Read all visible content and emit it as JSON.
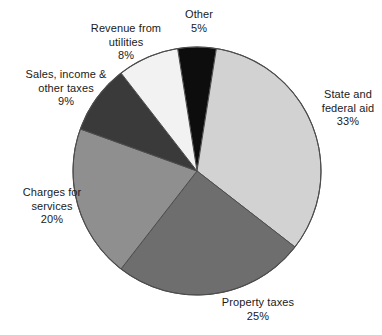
{
  "chart_data": {
    "type": "pie",
    "title": "",
    "subtitle": "",
    "xlabel": "",
    "ylabel": "",
    "legend_position": "none",
    "grid": false,
    "value_unit": "%",
    "start_angle_deg": -9,
    "direction": "clockwise",
    "categories": [
      "Other",
      "State and federal aid",
      "Property taxes",
      "Charges for services",
      "Sales, income & other taxes",
      "Revenue from utilities"
    ],
    "values": [
      5,
      33,
      25,
      20,
      9,
      8
    ],
    "slices": [
      {
        "id": "other",
        "label_line1": "Other",
        "label_line2": "",
        "value": 5,
        "value_text": "5%",
        "color": "#0d0d0d"
      },
      {
        "id": "state-and-federal-aid",
        "label_line1": "State and",
        "label_line2": "federal aid",
        "value": 33,
        "value_text": "33%",
        "color": "#d2d2d2"
      },
      {
        "id": "property-taxes",
        "label_line1": "Property taxes",
        "label_line2": "",
        "value": 25,
        "value_text": "25%",
        "color": "#6e6e6e"
      },
      {
        "id": "charges-for-services",
        "label_line1": "Charges for",
        "label_line2": "services",
        "value": 20,
        "value_text": "20%",
        "color": "#8f8f8f"
      },
      {
        "id": "sales-income-other-taxes",
        "label_line1": "Sales, income &",
        "label_line2": "other taxes",
        "value": 9,
        "value_text": "9%",
        "color": "#3a3a3a"
      },
      {
        "id": "revenue-from-utilities",
        "label_line1": "Revenue from",
        "label_line2": "utilities",
        "value": 8,
        "value_text": "8%",
        "color": "#f2f2f2"
      }
    ],
    "geometry": {
      "center_x": 197,
      "center_y": 171,
      "radius": 124,
      "outline_color": "#4d4d4d",
      "divider_color": "#4d4d4d",
      "background": "#ffffff"
    }
  }
}
